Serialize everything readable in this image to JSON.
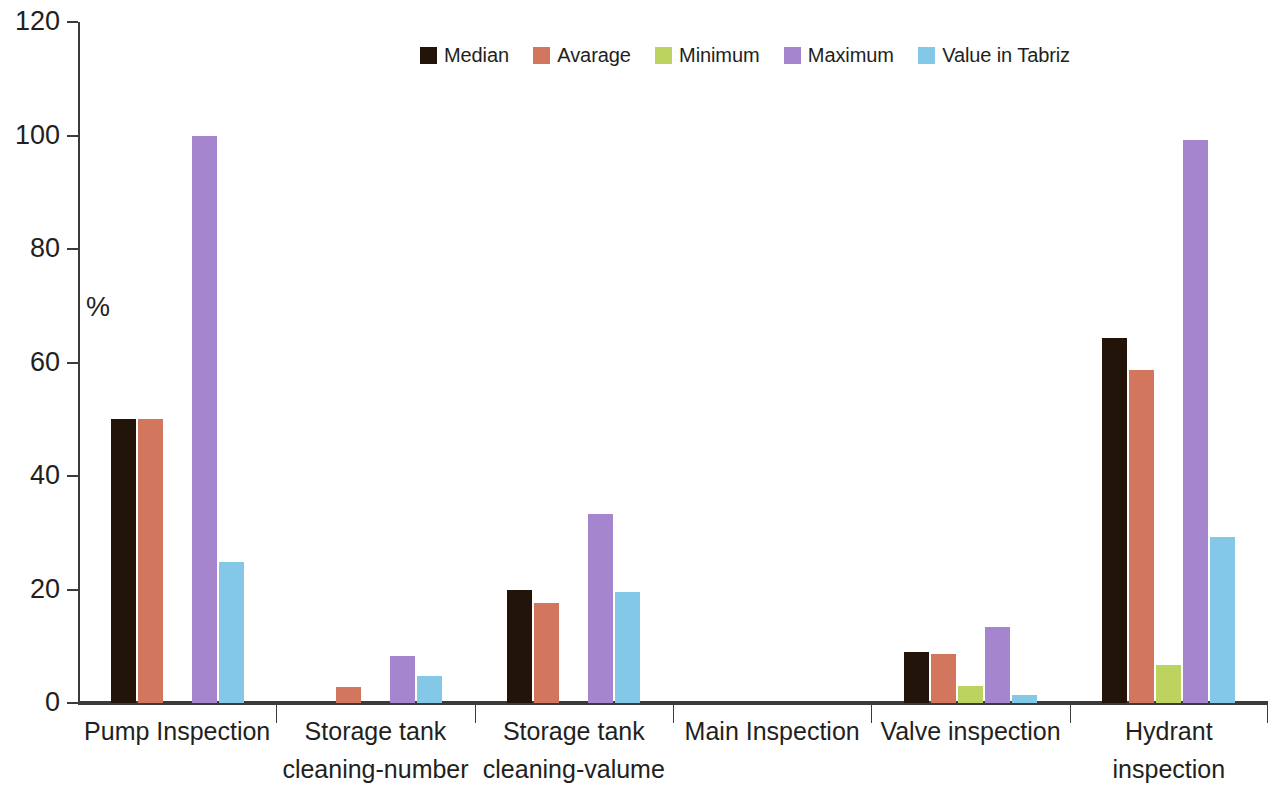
{
  "chart_data": {
    "type": "bar",
    "title": "",
    "subtitle": "",
    "xlabel": "",
    "ylabel": "%",
    "ylim": [
      0,
      120
    ],
    "yticks": [
      0,
      20,
      40,
      60,
      80,
      100,
      120
    ],
    "grid": false,
    "legend_position": "top-center",
    "categories": [
      "Pump Inspection",
      "Storage tank cleaning-number",
      "Storage tank cleaning-valume",
      "Main Inspection",
      "Valve inspection",
      "Hydrant inspection"
    ],
    "category_lines": [
      [
        "Pump Inspection"
      ],
      [
        "Storage tank",
        "cleaning-number"
      ],
      [
        "Storage tank",
        "cleaning-valume"
      ],
      [
        "Main Inspection"
      ],
      [
        "Valve inspection"
      ],
      [
        "Hydrant",
        "inspection"
      ]
    ],
    "series": [
      {
        "name": "Median",
        "color": "#231409",
        "values": [
          50.0,
          0.0,
          19.9,
          0.0,
          9.0,
          64.3
        ]
      },
      {
        "name": "Avarage",
        "color": "#d2775e",
        "values": [
          50.0,
          2.8,
          17.6,
          0.0,
          8.6,
          58.6
        ]
      },
      {
        "name": "Minimum",
        "color": "#bcd45f",
        "values": [
          0.0,
          0.0,
          0.0,
          0.0,
          3.0,
          6.7
        ]
      },
      {
        "name": "Maximum",
        "color": "#a585cd",
        "values": [
          100.0,
          8.3,
          33.3,
          0.0,
          13.4,
          99.2
        ]
      },
      {
        "name": "Value  in Tabriz",
        "color": "#84c8e8",
        "values": [
          24.8,
          4.8,
          19.6,
          0.0,
          1.4,
          29.2
        ]
      }
    ]
  },
  "legend": {
    "entries": [
      {
        "label": "Median",
        "color": "#231409"
      },
      {
        "label": "Avarage",
        "color": "#d2775e"
      },
      {
        "label": "Minimum",
        "color": "#bcd45f"
      },
      {
        "label": "Maximum",
        "color": "#a585cd"
      },
      {
        "label": "Value  in Tabriz",
        "color": "#84c8e8"
      }
    ]
  },
  "axes": {
    "y_title": "%",
    "y_tick_labels": [
      "0",
      "20",
      "40",
      "60",
      "80",
      "100",
      "120"
    ],
    "axis_color": "#3b3b3b"
  }
}
